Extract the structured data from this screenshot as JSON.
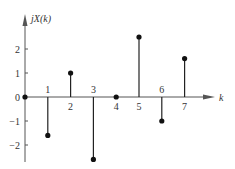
{
  "chart_data": {
    "type": "stem",
    "title": "",
    "xlabel": "k",
    "ylabel": "jX(k)",
    "x": [
      0,
      1,
      2,
      3,
      4,
      5,
      6,
      7
    ],
    "values": [
      0,
      -1.6,
      1,
      -2.6,
      0,
      2.5,
      -1,
      1.6
    ],
    "x_tick_labels": [
      "0",
      "1",
      "2",
      "3",
      "4",
      "5",
      "6",
      "7"
    ],
    "y_ticks": [
      2,
      1,
      0,
      -1,
      -2
    ],
    "y_tick_labels": [
      "2",
      "1",
      "0",
      "−1",
      "−2"
    ],
    "ylim": [
      -2.9,
      3.5
    ],
    "xlim": [
      0,
      8
    ],
    "grid": false,
    "legend": null
  },
  "colors": {
    "stem": "#222222",
    "axis": "#555555",
    "marker": "#111111"
  }
}
